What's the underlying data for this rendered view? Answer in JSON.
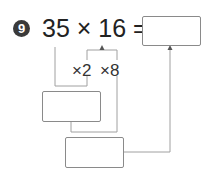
{
  "problem": {
    "number": "9",
    "expression": "35 × 16 =",
    "steps": [
      {
        "label": "×2"
      },
      {
        "label": "×8"
      }
    ],
    "answer_box": "",
    "intermediate_box": "",
    "final_box": ""
  },
  "colors": {
    "line": "#9a9a9a",
    "circle": "#3a3a3a",
    "text": "#222222"
  }
}
